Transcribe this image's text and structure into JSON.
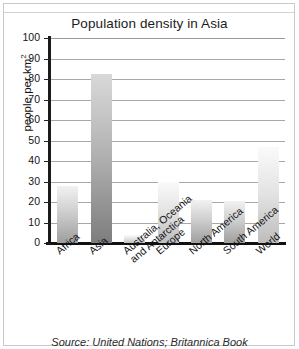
{
  "chart_data": {
    "type": "bar",
    "title": "Population density in Asia",
    "xlabel": "",
    "ylabel": "people per km",
    "ylabel_sup": "2",
    "ylim": [
      0,
      100
    ],
    "yticks": [
      100,
      90,
      80,
      70,
      60,
      50,
      40,
      30,
      20,
      10,
      0
    ],
    "grid": true,
    "legend": "none",
    "categories": [
      "Africa",
      "Asia",
      "Australia, Oceania\nand Antarctica",
      "Europe",
      "North America",
      "South America",
      "World"
    ],
    "values": [
      28,
      82.5,
      4,
      30,
      21,
      20.5,
      47
    ],
    "bar_styles": [
      "normal",
      "dark",
      "pale",
      "pale",
      "normal",
      "normal",
      "pale"
    ],
    "source": "Source: United Nations; Britannica Book"
  },
  "colors": {
    "axis": "#111111",
    "grid": "#a8a8a8",
    "text": "#141414",
    "frame": "#c9c9c9"
  }
}
